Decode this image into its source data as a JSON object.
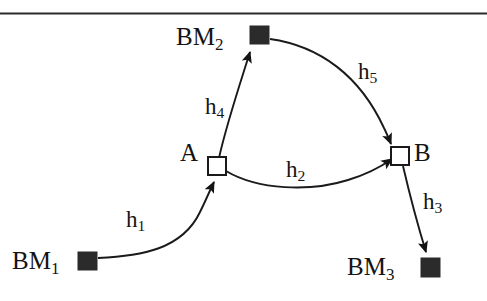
{
  "figure": {
    "kind": "leveling-network-diagram",
    "top_rule": {
      "present": true,
      "color": "#2b2b2b"
    },
    "colors": {
      "ink": "#141414",
      "stroke": "#1a1a1a",
      "benchmark_fill": "#2b2b2b",
      "unknown_point_fill": "#ffffff",
      "background": "#ffffff"
    },
    "nodes": [
      {
        "id": "BM1",
        "label": "BM",
        "subscript": "1",
        "type": "benchmark",
        "marker": "filled-square",
        "x": 87,
        "y": 261,
        "label_x": 12,
        "label_y": 248
      },
      {
        "id": "BM2",
        "label": "BM",
        "subscript": "2",
        "type": "benchmark",
        "marker": "filled-square",
        "x": 259,
        "y": 35,
        "label_x": 176,
        "label_y": 24
      },
      {
        "id": "BM3",
        "label": "BM",
        "subscript": "3",
        "type": "benchmark",
        "marker": "filled-square",
        "x": 430,
        "y": 267,
        "label_x": 347,
        "label_y": 254
      },
      {
        "id": "A",
        "label": "A",
        "subscript": "",
        "type": "unknown-point",
        "marker": "hollow-square",
        "x": 217,
        "y": 166,
        "label_x": 180,
        "label_y": 140
      },
      {
        "id": "B",
        "label": "B",
        "subscript": "",
        "type": "unknown-point",
        "marker": "hollow-square",
        "x": 400,
        "y": 156,
        "label_x": 414,
        "label_y": 140
      }
    ],
    "edges": [
      {
        "id": "h1",
        "label": "h",
        "subscript": "1",
        "from": "BM1",
        "to": "A",
        "arrow_at": "A",
        "label_x": 126,
        "label_y": 208
      },
      {
        "id": "h2",
        "label": "h",
        "subscript": "2",
        "from": "A",
        "to": "B",
        "arrow_at": "B",
        "label_x": 286,
        "label_y": 158
      },
      {
        "id": "h3",
        "label": "h",
        "subscript": "3",
        "from": "B",
        "to": "BM3",
        "arrow_at": "BM3",
        "label_x": 423,
        "label_y": 190
      },
      {
        "id": "h4",
        "label": "h",
        "subscript": "4",
        "from": "A",
        "to": "BM2",
        "arrow_at": "BM2",
        "label_x": 205,
        "label_y": 95
      },
      {
        "id": "h5",
        "label": "h",
        "subscript": "5",
        "from": "BM2",
        "to": "B",
        "arrow_at": "B",
        "label_x": 358,
        "label_y": 60
      }
    ]
  }
}
